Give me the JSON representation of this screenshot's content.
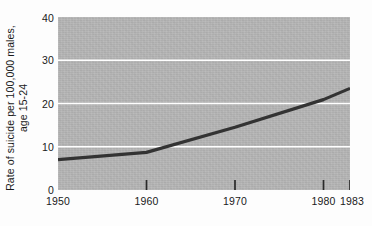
{
  "chart_data": {
    "type": "line",
    "title": "",
    "subtitle": "",
    "xlabel": "",
    "ylabel_line1": "Rate of suicide per 100,000 males,",
    "ylabel_line2": "age 15-24",
    "x": [
      1950,
      1960,
      1970,
      1980,
      1983
    ],
    "values": [
      7.0,
      8.7,
      14.5,
      20.9,
      23.5
    ],
    "series": [
      {
        "name": "Rate of suicide per 100,000 males, age 15-24",
        "values": [
          7.0,
          8.7,
          14.5,
          20.9,
          23.5
        ]
      }
    ],
    "xlim": [
      1950,
      1983
    ],
    "ylim": [
      0,
      40
    ],
    "xticks": [
      1950,
      1960,
      1970,
      1980,
      1983
    ],
    "xtick_labels": [
      "1950",
      "1960",
      "1970",
      "1980",
      "1983"
    ],
    "yticks": [
      0,
      10,
      20,
      30,
      40
    ],
    "ytick_labels": [
      "0",
      "10",
      "20",
      "30",
      "40"
    ],
    "gridlines_y": [
      10,
      20,
      30
    ],
    "grid": true,
    "grid_color": "#ffffff",
    "legend": false,
    "legend_position": "none",
    "plot_background": "#b4b4b4",
    "figure_background": "#fdfdfd",
    "line_color": "#333333",
    "line_width": 3,
    "tick_color": "#1a1a1a",
    "text_color": "#1a1a1a",
    "annotations": []
  }
}
